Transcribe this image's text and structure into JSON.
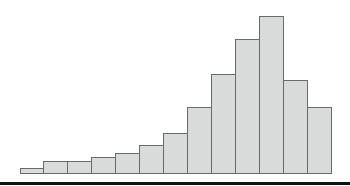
{
  "chart_data": {
    "type": "bar",
    "subtype": "histogram",
    "title": "",
    "xlabel": "",
    "ylabel": "",
    "categories": [
      "1",
      "2",
      "3",
      "4",
      "5",
      "6",
      "7",
      "8",
      "9",
      "10",
      "11",
      "12",
      "13"
    ],
    "values": [
      5,
      12,
      12,
      16,
      20,
      28,
      40,
      66,
      99,
      134,
      157,
      93,
      66
    ],
    "value_units": "relative bar height (px, no axis scale shown)",
    "grid": false,
    "legend": null,
    "colors": {
      "bar_fill": "#d9dbdb",
      "bar_edge": "#6a6a6a",
      "axis": "#111111"
    },
    "layout": {
      "baseline_y": 173,
      "bar_left_x": [
        20,
        43,
        67,
        91,
        115,
        139,
        163,
        187,
        211,
        235,
        259,
        283,
        307
      ],
      "bar_width": 24
    }
  }
}
